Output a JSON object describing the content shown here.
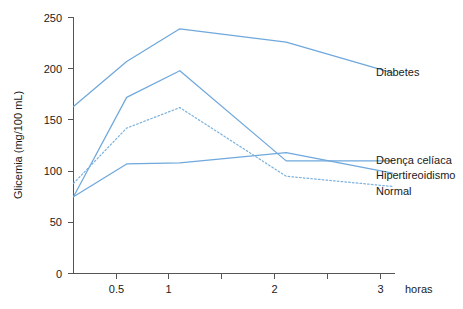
{
  "chart_data": {
    "type": "line",
    "title": "",
    "xlabel": "horas",
    "ylabel": "Glicemia (mg/100 mL)",
    "xlim": [
      0,
      3.2
    ],
    "ylim": [
      0,
      250
    ],
    "grid": false,
    "legend_position": "right-inline",
    "x_ticks": [
      0.5,
      1,
      2,
      3
    ],
    "x_tick_labels": [
      "0.5",
      "1",
      "2",
      "3"
    ],
    "x_minor_ticks": [
      1.5,
      2.5
    ],
    "y_ticks": [
      0,
      50,
      100,
      150,
      200,
      250
    ],
    "y_tick_labels": [
      "0",
      "50",
      "100",
      "150",
      "200",
      "250"
    ],
    "x": [
      0,
      0.5,
      1,
      2,
      3
    ],
    "series": [
      {
        "name": "Diabetes",
        "color": "#6fa8dc",
        "style": "solid",
        "values": [
          163,
          207,
          239,
          226,
          196
        ]
      },
      {
        "name": "Doença celíaca",
        "color": "#6fa8dc",
        "style": "solid",
        "values": [
          75,
          172,
          198,
          110,
          110
        ]
      },
      {
        "name": "Hipertireoidismo",
        "color": "#6fa8dc",
        "style": "solid",
        "values": [
          75,
          107,
          108,
          118,
          98
        ]
      },
      {
        "name": "Normal",
        "color": "#7fb3dd",
        "style": "dotted",
        "values": [
          88,
          142,
          162,
          95,
          85
        ]
      }
    ]
  },
  "labels": {
    "y_axis_title": "Glicemia (mg/100 mL)",
    "x_axis_title": "horas",
    "series_diabetes": "Diabetes",
    "series_celiaca": "Doença celíaca",
    "series_hipertireoidismo": "Hipertireoidismo",
    "series_normal": "Normal",
    "y_tick_0": "0",
    "y_tick_50": "50",
    "y_tick_100": "100",
    "y_tick_150": "150",
    "y_tick_200": "200",
    "y_tick_250": "250",
    "x_tick_05": "0.5",
    "x_tick_1": "1",
    "x_tick_2": "2",
    "x_tick_3": "3"
  },
  "colors": {
    "line": "#6fa8dc",
    "dotted_line": "#7fb3dd",
    "axis": "#555555",
    "text": "#1a1a1a",
    "background": "#ffffff"
  }
}
